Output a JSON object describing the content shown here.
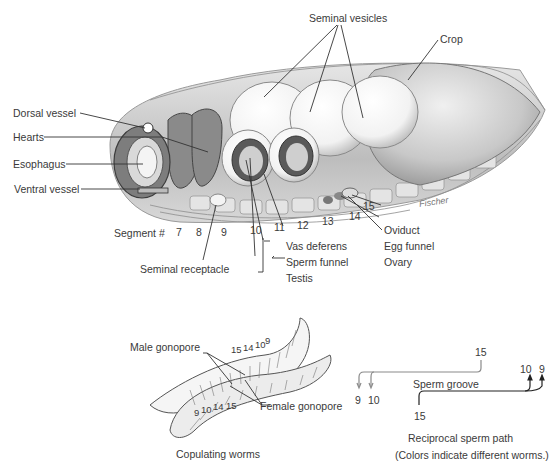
{
  "anatomy": {
    "labels": {
      "seminal_vesicles": "Seminal vesicles",
      "crop": "Crop",
      "dorsal_vessel": "Dorsal vessel",
      "hearts": "Hearts",
      "esophagus": "Esophagus",
      "ventral_vessel": "Ventral vessel",
      "segment": "Segment #",
      "seminal_receptacle": "Seminal receptacle",
      "vas_deferens": "Vas deferens",
      "sperm_funnel": "Sperm funnel",
      "testis": "Testis",
      "oviduct": "Oviduct",
      "egg_funnel": "Egg funnel",
      "ovary": "Ovary",
      "signature": "Fischer"
    },
    "segments": [
      "7",
      "8",
      "9",
      "10",
      "11",
      "12",
      "13",
      "14",
      "15"
    ]
  },
  "copulation": {
    "male_gonopore": "Male gonopore",
    "female_gonopore": "Female gonopore",
    "upper_worm_segments": [
      "15",
      "14",
      "10",
      "9"
    ],
    "lower_worm_segments": [
      "9",
      "10",
      "14",
      "15"
    ],
    "caption": "Copulating worms"
  },
  "sperm_path": {
    "top_start": "15",
    "top_ends": [
      "9",
      "10"
    ],
    "groove_label": "Sperm groove",
    "bottom_start": "15",
    "bottom_ends": [
      "10",
      "9"
    ],
    "caption": "Reciprocal sperm path",
    "note": "(Colors indicate different worms.)",
    "colors": {
      "worm_a": "#8a8a8a",
      "worm_b": "#222222"
    }
  }
}
